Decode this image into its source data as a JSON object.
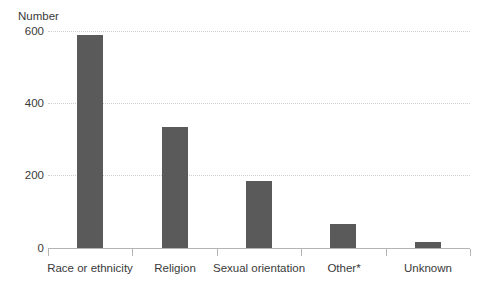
{
  "chart_data": {
    "type": "bar",
    "title": "",
    "xlabel": "",
    "ylabel": "Number",
    "categories": [
      "Race or ethnicity",
      "Religion",
      "Sexual orientation",
      "Other*",
      "Unknown"
    ],
    "values": [
      590,
      334,
      185,
      66,
      17
    ],
    "series": [
      {
        "name": "Number",
        "values": [
          590,
          334,
          185,
          66,
          17
        ]
      }
    ],
    "ylim": [
      0,
      600
    ],
    "yticks": [
      0,
      200,
      400,
      600
    ],
    "ytick_labels": [
      "0",
      "200",
      "400",
      "600"
    ],
    "grid": "horizontal-dotted",
    "legend": "none",
    "bar_color": "#5a5a5a",
    "grid_color": "#cfcfcf",
    "axis_color": "#b4b4b4",
    "text_color": "#3a3a3a"
  },
  "axis": {
    "y_title": "Number"
  },
  "clipped_title": ""
}
